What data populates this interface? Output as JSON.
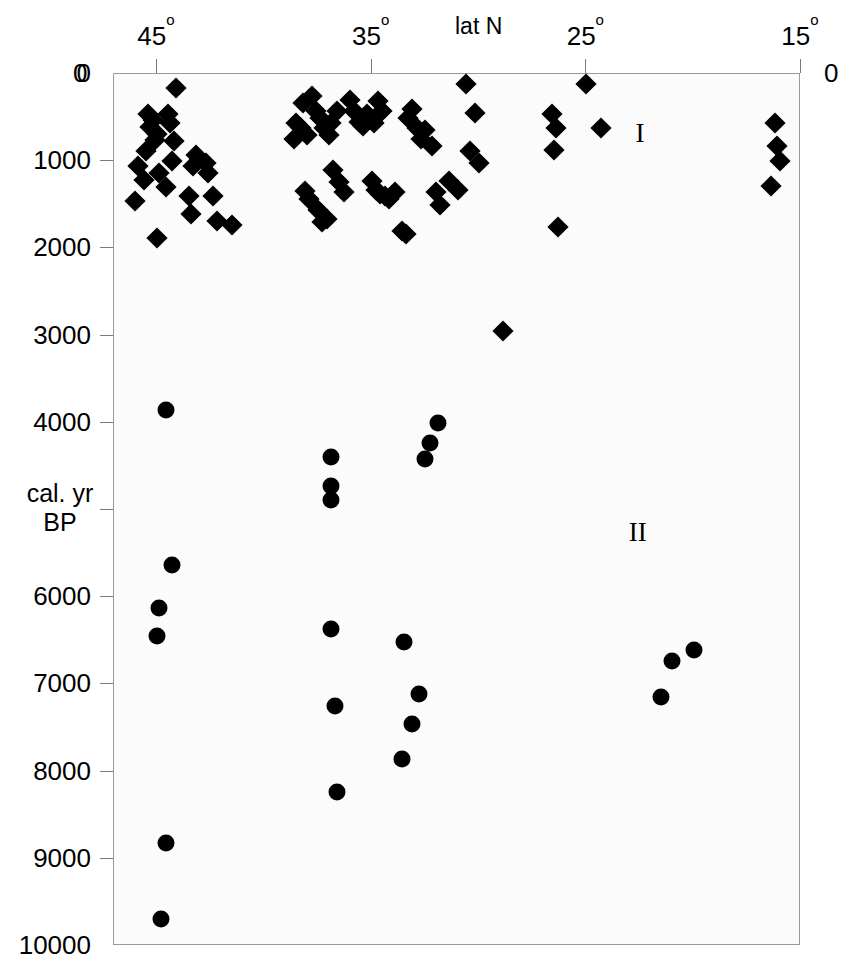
{
  "chart_data": {
    "type": "scatter",
    "title": "",
    "xlabel": "lat N",
    "ylabel": "cal. yr BP",
    "xlim": [
      47.0,
      15.0
    ],
    "ylim": [
      0,
      10000
    ],
    "x_axis_position": "top",
    "y_axis_inverted": true,
    "grid": false,
    "legend": "none",
    "x_ticks": [
      45,
      35,
      25,
      15
    ],
    "x_tick_labels": [
      "45°",
      "35°",
      "25°",
      "15°"
    ],
    "y_ticks": [
      0,
      1000,
      2000,
      3000,
      4000,
      5000,
      6000,
      7000,
      8000,
      9000,
      10000
    ],
    "y_tick_labels": [
      "0",
      "1000",
      "2000",
      "3000",
      "4000",
      "5000",
      "6000",
      "7000",
      "8000",
      "9000",
      "10000"
    ],
    "y_tick_labels_shown": [
      "0",
      "1000",
      "2000",
      "3000",
      "4000",
      "6000",
      "7000",
      "8000",
      "9000",
      "10000"
    ],
    "corner_labels": {
      "top_left": "0",
      "top_right": "0"
    },
    "annotations": [
      {
        "text": "I",
        "x": 22.5,
        "y": 680
      },
      {
        "text": "II",
        "x": 22.6,
        "y": 5250
      }
    ],
    "series": [
      {
        "name": "I",
        "marker": "diamond",
        "color": "#000000",
        "size": 15,
        "points": [
          [
            44.1,
            160
          ],
          [
            45.4,
            460
          ],
          [
            45.2,
            530
          ],
          [
            45.3,
            610
          ],
          [
            45.0,
            690
          ],
          [
            45.1,
            760
          ],
          [
            45.5,
            880
          ],
          [
            45.9,
            1060
          ],
          [
            45.6,
            1210
          ],
          [
            46.0,
            1460
          ],
          [
            44.5,
            460
          ],
          [
            44.4,
            560
          ],
          [
            44.2,
            770
          ],
          [
            44.3,
            1000
          ],
          [
            44.9,
            1140
          ],
          [
            44.6,
            1300
          ],
          [
            45.0,
            1880
          ],
          [
            43.3,
            1050
          ],
          [
            43.2,
            930
          ],
          [
            43.5,
            1400
          ],
          [
            43.4,
            1600
          ],
          [
            42.7,
            1020
          ],
          [
            42.6,
            1130
          ],
          [
            42.4,
            1400
          ],
          [
            42.2,
            1690
          ],
          [
            41.5,
            1730
          ],
          [
            38.2,
            330
          ],
          [
            37.8,
            250
          ],
          [
            37.6,
            420
          ],
          [
            37.4,
            500
          ],
          [
            37.2,
            620
          ],
          [
            37.0,
            700
          ],
          [
            36.9,
            560
          ],
          [
            36.6,
            430
          ],
          [
            38.5,
            560
          ],
          [
            38.3,
            620
          ],
          [
            38.0,
            700
          ],
          [
            38.6,
            740
          ],
          [
            38.1,
            1340
          ],
          [
            37.9,
            1430
          ],
          [
            37.5,
            1560
          ],
          [
            37.3,
            1700
          ],
          [
            37.1,
            1660
          ],
          [
            36.8,
            1100
          ],
          [
            36.5,
            1240
          ],
          [
            36.3,
            1350
          ],
          [
            36.0,
            300
          ],
          [
            35.8,
            420
          ],
          [
            35.6,
            550
          ],
          [
            35.4,
            600
          ],
          [
            35.2,
            460
          ],
          [
            34.9,
            560
          ],
          [
            34.7,
            310
          ],
          [
            34.5,
            420
          ],
          [
            35.0,
            1230
          ],
          [
            34.8,
            1330
          ],
          [
            34.6,
            1380
          ],
          [
            34.4,
            1400
          ],
          [
            34.2,
            1430
          ],
          [
            33.9,
            1350
          ],
          [
            33.6,
            1800
          ],
          [
            33.4,
            1830
          ],
          [
            33.3,
            500
          ],
          [
            33.1,
            400
          ],
          [
            32.9,
            620
          ],
          [
            32.7,
            740
          ],
          [
            32.5,
            640
          ],
          [
            32.2,
            830
          ],
          [
            32.0,
            1350
          ],
          [
            31.8,
            1500
          ],
          [
            31.4,
            1230
          ],
          [
            31.0,
            1330
          ],
          [
            30.6,
            110
          ],
          [
            30.2,
            450
          ],
          [
            30.4,
            880
          ],
          [
            30.0,
            1020
          ],
          [
            28.9,
            2950
          ],
          [
            26.6,
            460
          ],
          [
            26.4,
            620
          ],
          [
            26.5,
            870
          ],
          [
            26.3,
            1760
          ],
          [
            25.0,
            110
          ],
          [
            24.3,
            620
          ],
          [
            16.2,
            560
          ],
          [
            16.1,
            830
          ],
          [
            16.0,
            1000
          ],
          [
            16.4,
            1290
          ]
        ]
      },
      {
        "name": "II",
        "marker": "circle",
        "color": "#000000",
        "size": 17,
        "points": [
          [
            44.6,
            3850
          ],
          [
            44.3,
            5630
          ],
          [
            44.9,
            6120
          ],
          [
            45.0,
            6440
          ],
          [
            44.6,
            8820
          ],
          [
            44.8,
            9690
          ],
          [
            36.9,
            4390
          ],
          [
            36.9,
            4720
          ],
          [
            36.9,
            4880
          ],
          [
            36.9,
            6370
          ],
          [
            36.7,
            7250
          ],
          [
            36.6,
            8230
          ],
          [
            31.9,
            4000
          ],
          [
            32.3,
            4230
          ],
          [
            32.5,
            4420
          ],
          [
            33.5,
            6510
          ],
          [
            32.8,
            7110
          ],
          [
            33.1,
            7450
          ],
          [
            33.6,
            7850
          ],
          [
            21.5,
            7150
          ],
          [
            21.0,
            6730
          ],
          [
            20.0,
            6600
          ]
        ]
      }
    ]
  },
  "axis": {
    "x_title": "lat N",
    "y_title_line1": "cal. yr",
    "y_title_line2": "BP",
    "top_left_zero": "0",
    "top_right_zero": "0"
  }
}
